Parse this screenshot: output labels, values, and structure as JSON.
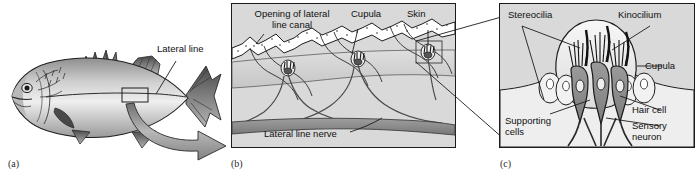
{
  "figure": {
    "background_color": "#ffffff",
    "panel_fill": "#d9d9d9",
    "ink_color": "#101010"
  },
  "panels": [
    {
      "key": "a",
      "caption": "(a)",
      "subject": "whole fish showing lateral line",
      "framed": false,
      "labels": [
        {
          "name": "lateral-line",
          "text": "Lateral line"
        }
      ]
    },
    {
      "key": "b",
      "caption": "(b)",
      "subject": "lateral line canal cross-section with neuromasts",
      "framed": true,
      "labels": [
        {
          "name": "opening-of-lateral-line-canal",
          "text": "Opening of lateral\nline canal"
        },
        {
          "name": "cupula",
          "text": "Cupula"
        },
        {
          "name": "skin",
          "text": "Skin"
        },
        {
          "name": "lateral-line-nerve",
          "text": "Lateral line nerve"
        }
      ]
    },
    {
      "key": "c",
      "caption": "(c)",
      "subject": "neuromast detail with hair cells",
      "framed": true,
      "labels": [
        {
          "name": "stereocilia",
          "text": "Stereocilia"
        },
        {
          "name": "kinocilium",
          "text": "Kinocilium"
        },
        {
          "name": "cupula",
          "text": "Cupula"
        },
        {
          "name": "hair-cell",
          "text": "Hair cell"
        },
        {
          "name": "sensory-neuron",
          "text": "Sensory\nneuron"
        },
        {
          "name": "supporting-cells",
          "text": "Supporting\ncells"
        }
      ]
    }
  ]
}
